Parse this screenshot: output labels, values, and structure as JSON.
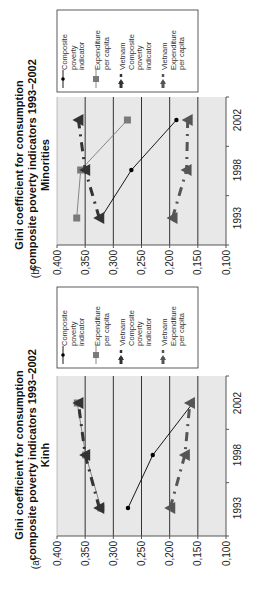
{
  "chart_data": [
    {
      "panel": "(a)",
      "type": "line",
      "title": "Gini coefficient for consumption composite poverty indicators 1993–2002",
      "subtitle": "Kinh",
      "title_lines": [
        "Gini coefficient for consumption",
        "composite poverty indicators 1993–2002",
        "Kinh"
      ],
      "xlabel": "",
      "ylabel": "",
      "categories": [
        "1993",
        "1998",
        "2002"
      ],
      "y_ticks": [
        "0,400",
        "0,350",
        "0,300",
        "0,250",
        "0,200",
        "0,150",
        "0,100"
      ],
      "ylim": [
        0.1,
        0.4
      ],
      "grid": true,
      "legend_position": "right",
      "orientation": "rotated 90° counter-clockwise",
      "series": [
        {
          "name": "Composite poverty indicator",
          "legend_lines": [
            "Composite",
            "poverty",
            "indicator"
          ],
          "values": [
            0.274,
            0.23,
            0.159
          ],
          "color": "#000000",
          "marker": "dot",
          "line": "solid-thin"
        },
        {
          "name": "Expenditure per capita",
          "legend_lines": [
            "Expenditure",
            "per capita"
          ],
          "values": [
            0.322,
            0.349,
            0.364
          ],
          "color": "#7a7a7a",
          "marker": "square",
          "line": "solid-thin"
        },
        {
          "name": "Vietnam Composite poverty indicator",
          "legend_lines": [
            "Vietnam",
            "Composite",
            "poverty",
            "indicator"
          ],
          "values": [
            0.325,
            0.35,
            0.362
          ],
          "color": "#333333",
          "marker": "triangle",
          "line": "dash-dot-thick"
        },
        {
          "name": "Vietnam Expenditure per capita",
          "legend_lines": [
            "Vietnam",
            "Expenditure",
            "per capita"
          ],
          "values": [
            0.199,
            0.173,
            0.164
          ],
          "color": "#555555",
          "marker": "triangle",
          "line": "dash-dot-thick"
        }
      ]
    },
    {
      "panel": "(b)",
      "type": "line",
      "title": "Gini coefficient for consumption composite poverty indicators 1993–2002",
      "subtitle": "Minorities",
      "title_lines": [
        "Gini coefficient for consumption",
        "composite poverty indicators 1993–2002",
        "Minorities"
      ],
      "xlabel": "",
      "ylabel": "",
      "categories": [
        "1993",
        "1998",
        "2002"
      ],
      "y_ticks": [
        "0,400",
        "0,350",
        "0,300",
        "0,250",
        "0,200",
        "0,150",
        "0,100"
      ],
      "ylim": [
        0.1,
        0.4
      ],
      "grid": true,
      "legend_position": "right",
      "orientation": "rotated 90° counter-clockwise",
      "series": [
        {
          "name": "Composite poverty indicator",
          "legend_lines": [
            "Composite",
            "poverty",
            "indicator"
          ],
          "values": [
            0.322,
            0.268,
            0.188
          ],
          "color": "#000000",
          "marker": "dot",
          "line": "solid-thin"
        },
        {
          "name": "Expenditure per capita",
          "legend_lines": [
            "Expenditure",
            "per capita"
          ],
          "values": [
            0.365,
            0.358,
            0.275
          ],
          "color": "#7a7a7a",
          "marker": "square",
          "line": "solid-thin"
        },
        {
          "name": "Vietnam Composite poverty indicator",
          "legend_lines": [
            "Vietnam",
            "Composite",
            "poverty",
            "indicator"
          ],
          "values": [
            0.325,
            0.35,
            0.362
          ],
          "color": "#333333",
          "marker": "triangle",
          "line": "dash-dot-thick"
        },
        {
          "name": "Vietnam Expenditure per capita",
          "legend_lines": [
            "Vietnam",
            "Expenditure",
            "per capita"
          ],
          "values": [
            0.195,
            0.17,
            0.168
          ],
          "color": "#555555",
          "marker": "triangle",
          "line": "dash-dot-thick"
        }
      ]
    }
  ],
  "style": {
    "plot_background": "#e8e8e8",
    "gridline_color": "#333333",
    "axis_color": "#555555"
  }
}
